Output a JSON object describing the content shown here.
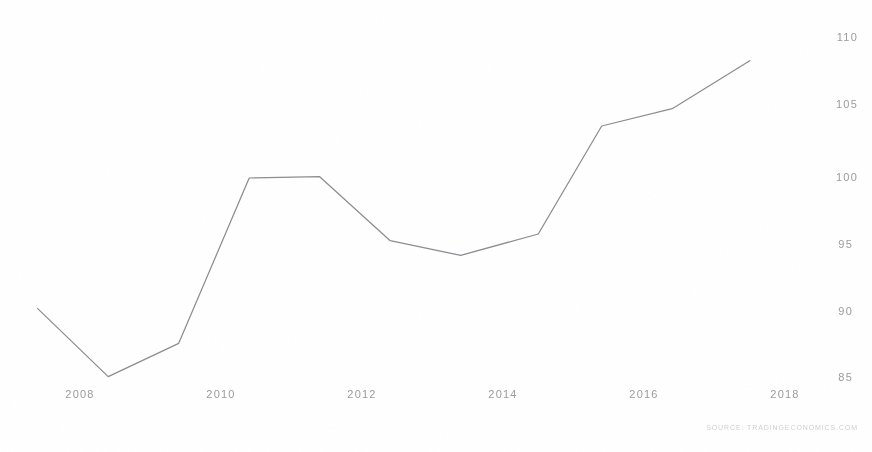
{
  "chart_data": {
    "type": "line",
    "title": "",
    "subtitle": "",
    "xlabel": "",
    "ylabel": "",
    "xlim": [
      2007.2,
      2018.6
    ],
    "ylim": [
      83.0,
      111.5
    ],
    "grid": false,
    "legend": null,
    "line_color": "#8a8d91",
    "x_ticks": [
      2008,
      2010,
      2012,
      2014,
      2016,
      2018
    ],
    "x_tick_labels": [
      "2008",
      "2010",
      "2012",
      "2014",
      "2016",
      "2018"
    ],
    "y_ticks": [
      85,
      90,
      95,
      100,
      105,
      110
    ],
    "y_tick_labels": [
      "85",
      "90",
      "95",
      "100",
      "105",
      "110"
    ],
    "y_axis_position": "right",
    "series": [
      {
        "name": "Index",
        "x": [
          2007.4,
          2008.4,
          2009.4,
          2010.4,
          2011.4,
          2012.4,
          2013.4,
          2014.5,
          2015.4,
          2016.4,
          2017.5
        ],
        "values": [
          90.2,
          85.1,
          87.6,
          100.0,
          100.1,
          95.3,
          94.2,
          95.8,
          103.9,
          105.2,
          108.8
        ]
      }
    ],
    "annotations": []
  },
  "watermark": {
    "text": "SOURCE: TRADINGECONOMICS.COM"
  }
}
